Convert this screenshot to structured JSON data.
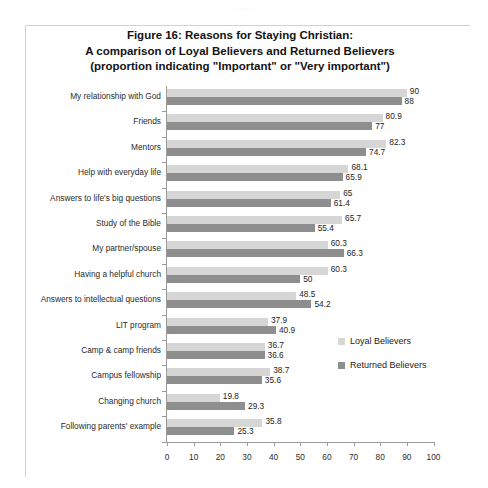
{
  "scan_artifact": {
    "text": ". .                    .     ."
  },
  "legend": {
    "position": "inside-right",
    "items": [
      {
        "label": "Loyal Believers",
        "color": "#d6d6d6"
      },
      {
        "label": "Returned Believers",
        "color": "#8e8e8e"
      }
    ]
  },
  "axis": {
    "x_ticks": [
      "0",
      "10",
      "20",
      "30",
      "40",
      "50",
      "60",
      "70",
      "80",
      "90",
      "100"
    ]
  },
  "chart_data": {
    "type": "bar",
    "orientation": "horizontal",
    "title": "Figure 16: Reasons for Staying Christian: A comparison of Loyal Believers and Returned Believers (proportion indicating \"Important\" or \"Very important\")",
    "title_lines": [
      "Figure 16: Reasons for Staying Christian:",
      "A comparison of Loyal Believers and Returned Believers",
      "(proportion indicating \"Important\" or \"Very important\")"
    ],
    "xlabel": "",
    "ylabel": "",
    "xlim": [
      0,
      100
    ],
    "xticks": [
      0,
      10,
      20,
      30,
      40,
      50,
      60,
      70,
      80,
      90,
      100
    ],
    "grid": false,
    "legend_position": "inside-right",
    "categories": [
      "My relationship with God",
      "Friends",
      "Mentors",
      "Help with everyday life",
      "Answers to life's big questions",
      "Study of the Bible",
      "My partner/spouse",
      "Having a helpful church",
      "Answers to intellectual questions",
      "LIT program",
      "Camp & camp friends",
      "Campus fellowship",
      "Changing church",
      "Following parents' example"
    ],
    "series": [
      {
        "name": "Loyal Believers",
        "color": "#d6d6d6",
        "values": [
          90,
          80.9,
          82.3,
          68.1,
          65,
          65.7,
          60.3,
          60.3,
          48.5,
          37.9,
          36.7,
          38.7,
          19.8,
          35.8
        ],
        "labels": [
          "90",
          "80.9",
          "82.3",
          "68.1",
          "65",
          "65.7",
          "60.3",
          "60.3",
          "48.5",
          "37.9",
          "36.7",
          "38.7",
          "19.8",
          "35.8"
        ]
      },
      {
        "name": "Returned Believers",
        "color": "#8e8e8e",
        "values": [
          88,
          77,
          74.7,
          65.9,
          61.4,
          55.4,
          66.3,
          50,
          54.2,
          40.9,
          36.6,
          35.6,
          29.3,
          25.3
        ],
        "labels": [
          "88",
          "77",
          "74.7",
          "65.9",
          "61.4",
          "55.4",
          "66.3",
          "50",
          "54.2",
          "40.9",
          "36.6",
          "35.6",
          "29.3",
          "25.3"
        ]
      }
    ]
  }
}
